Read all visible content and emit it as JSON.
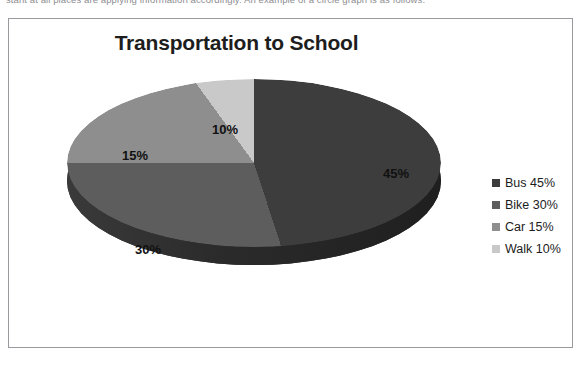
{
  "document": {
    "body_text_clipped": "stant at all places are applying information accordingly. An example of a circle graph is as follows:"
  },
  "chart_frame": {
    "border_color": "#9a9a9e",
    "background": "#ffffff"
  },
  "chart_data": {
    "type": "pie",
    "title": "Transportation to School",
    "subtitle": "",
    "xlabel": "",
    "ylabel": "",
    "three_d": true,
    "start_angle_deg": 0,
    "direction": "clockwise",
    "grid": false,
    "legend_position": "right",
    "categories": [
      "Bus",
      "Bike",
      "Car",
      "Walk"
    ],
    "values": [
      45,
      30,
      15,
      10
    ],
    "value_unit": "%",
    "data_labels": [
      "45%",
      "30%",
      "15%",
      "10%"
    ],
    "colors": [
      "#3d3d3d",
      "#5d5d5d",
      "#8e8e8e",
      "#c9c9c9"
    ],
    "legend_entries": [
      {
        "label": "Bus 45%",
        "color": "#3d3d3d"
      },
      {
        "label": "Bike 30%",
        "color": "#5d5d5d"
      },
      {
        "label": "Car 15%",
        "color": "#8e8e8e"
      },
      {
        "label": "Walk 10%",
        "color": "#c9c9c9"
      }
    ]
  }
}
